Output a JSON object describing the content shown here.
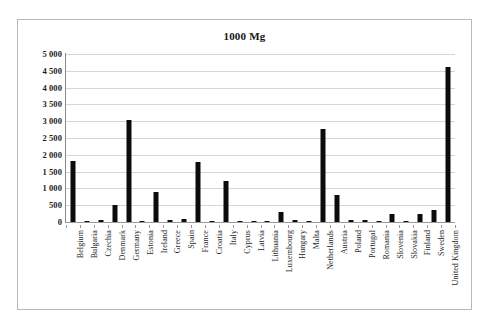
{
  "chart_data": {
    "type": "bar",
    "title": "1000 Mg",
    "xlabel": "",
    "ylabel": "",
    "ylim": [
      0,
      5000
    ],
    "grid": true,
    "legend": null,
    "y_ticks": [
      "0",
      "500",
      "1 000",
      "1 500",
      "2 000",
      "2 500",
      "3 000",
      "3 500",
      "4 000",
      "4 500",
      "5 000"
    ],
    "y_tick_values": [
      0,
      500,
      1000,
      1500,
      2000,
      2500,
      3000,
      3500,
      4000,
      4500,
      5000
    ],
    "bar_color": "#0c0c0c",
    "categories": [
      "Belgium",
      "Bulgaria",
      "Czechia",
      "Denmark",
      "Germany",
      "Estonia",
      "Ireland",
      "Greece",
      "Spain",
      "France",
      "Croatia",
      "Italy",
      "Cyprus",
      "Latvia",
      "Lithuania",
      "Luxembourg",
      "Hungary",
      "Malta",
      "Netherlands",
      "Austria",
      "Poland",
      "Portugal",
      "Romania",
      "Slovenia",
      "Slovakia",
      "Finland",
      "Sweden",
      "United Kingdom"
    ],
    "values": [
      1830,
      10,
      55,
      510,
      3030,
      5,
      880,
      55,
      90,
      1800,
      45,
      1230,
      10,
      25,
      25,
      300,
      60,
      15,
      2780,
      800,
      70,
      55,
      25,
      230,
      20,
      250,
      350,
      4600
    ]
  }
}
